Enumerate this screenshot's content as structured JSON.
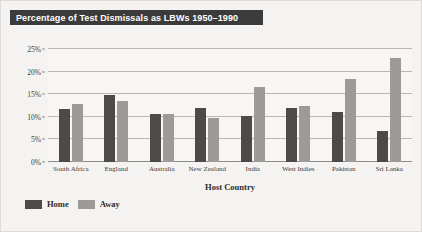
{
  "chart_data": {
    "type": "bar",
    "title": "Percentage of Test Dismissals as LBWs 1950–1990",
    "xlabel": "Host Country",
    "ylabel": "",
    "categories": [
      "South Africa",
      "England",
      "Australia",
      "New Zealand",
      "India",
      "West Indies",
      "Pakistan",
      "Sri Lanka"
    ],
    "series": [
      {
        "name": "Home",
        "color": "#4d4b49",
        "values": [
          11.8,
          14.8,
          10.6,
          11.9,
          10.1,
          12.0,
          11.1,
          6.8
        ]
      },
      {
        "name": "Away",
        "color": "#9d9b97",
        "values": [
          12.8,
          13.6,
          10.6,
          9.8,
          16.5,
          12.3,
          18.3,
          23.0
        ]
      }
    ],
    "ylim": [
      0,
      25
    ],
    "yticks": [
      0,
      5,
      10,
      15,
      20,
      25
    ],
    "ytick_labels": [
      "0%",
      "5%",
      "10%",
      "15%",
      "20%",
      "25%"
    ],
    "grid": true,
    "legend_position": "bottom-left"
  },
  "colors": {
    "title_bar_background": "#3b3b3b",
    "title_text": "#ffffff",
    "figure_background": "#f4f3f1",
    "plot_background": "#f7f6f4",
    "gridline": "#b9b7b3",
    "axis": "#8e8c88"
  }
}
